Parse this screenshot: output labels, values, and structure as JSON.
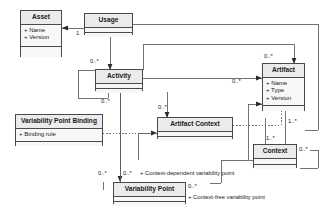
{
  "diagram": {
    "type": "uml-class-diagram",
    "background": "#ffffff",
    "line_color": "#4a4a4a",
    "box_fill": "#f2f2f2",
    "header_fill": "#ebebeb"
  },
  "classes": {
    "asset": {
      "name": "Asset",
      "attrs": [
        "+ Name",
        "+ Version"
      ]
    },
    "usage": {
      "name": "Usage",
      "attrs": []
    },
    "activity": {
      "name": "Activity",
      "attrs": []
    },
    "artifact": {
      "name": "Artifact",
      "attrs": [
        "+ Name",
        "+ Type",
        "+ Version"
      ]
    },
    "vpb": {
      "name": "Variability Point Binding",
      "attrs": [
        "+ Binding rule"
      ]
    },
    "artifact_context": {
      "name": "Artifact Context",
      "attrs": []
    },
    "context": {
      "name": "Context",
      "attrs": []
    },
    "variability_point": {
      "name": "Variability Point",
      "attrs": []
    }
  },
  "multiplicities": {
    "asset_usage": "1",
    "usage_activity": "0..*",
    "activity_self": "0..*",
    "artifact_top": "0..*",
    "artifact_left": "0..*",
    "artifact_context_top": "0..*",
    "artifact_context_count": "1..*",
    "context_to_artifact": "1..*",
    "context_self": "0..*",
    "vp_left": "0..*",
    "vp_mid": "0..*",
    "vp_right": "0..*"
  },
  "roles": {
    "context_dependent": "+ Context-dependent variability point",
    "context_free": "+ Context-free variability point"
  }
}
